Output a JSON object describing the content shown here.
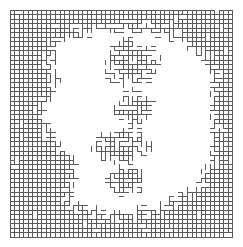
{
  "figure": {
    "kind": "bond-percolation-lattice",
    "title": "",
    "caption": "",
    "background_color": "#ffffff",
    "line_color": "#5a5a5a",
    "line_width": 1
  },
  "chart_data": {
    "type": "heatmap",
    "title": "",
    "subtitle": "",
    "xlabel": "",
    "ylabel": "",
    "grid": true,
    "legend": null,
    "lattice": {
      "columns": 49,
      "rows": 50,
      "cell_size": 4.55,
      "origin_x": 10,
      "origin_y": 10,
      "description": "Square lattice of sites; occupied bonds drawn as short segments between neighbouring sites. Dense occupation forms a connected perimeter ring; interior is mostly empty with one isolated interior cluster.",
      "occupancy_model": "region",
      "regions": [
        {
          "name": "outer-perimeter-band",
          "role": "dense",
          "probability": 0.97,
          "note": "Near-fully occupied band hugging all four edges of the lattice."
        },
        {
          "name": "perimeter-fringe",
          "role": "ragged-boundary",
          "probability": 0.55,
          "note": "Irregular, jagged inner boundary of the dense band; thickness varies from 1 to 10 cells."
        },
        {
          "name": "interior-void",
          "role": "empty",
          "probability": 0.0,
          "note": "Large blank elliptical interior where no bonds are present."
        },
        {
          "name": "interior-island-cluster",
          "role": "isolated-cluster",
          "probability": 0.85,
          "note": "Detached mid-size cluster floating in the interior void, roughly centred, shaped like a vertical chain of blobs."
        }
      ],
      "band_thickness_top": [
        10,
        10,
        10,
        10,
        9,
        9,
        8,
        8,
        7,
        6,
        5,
        5,
        4,
        4,
        4,
        4,
        4,
        4,
        3,
        3,
        3,
        3,
        3,
        3,
        3,
        3,
        3,
        3,
        3,
        3,
        3,
        4,
        4,
        4,
        4,
        5,
        5,
        5,
        6,
        7,
        8,
        8,
        9,
        10,
        10,
        10,
        10,
        10,
        10
      ],
      "band_thickness_bottom": [
        12,
        12,
        12,
        11,
        11,
        11,
        10,
        10,
        9,
        9,
        8,
        8,
        7,
        7,
        6,
        6,
        5,
        5,
        5,
        4,
        4,
        4,
        4,
        4,
        4,
        4,
        4,
        4,
        5,
        5,
        5,
        5,
        6,
        6,
        6,
        7,
        7,
        8,
        8,
        9,
        9,
        10,
        10,
        11,
        11,
        12,
        12,
        12,
        12
      ],
      "band_thickness_left": [
        10,
        10,
        10,
        10,
        10,
        9,
        9,
        9,
        8,
        8,
        8,
        8,
        8,
        9,
        9,
        9,
        9,
        8,
        8,
        7,
        7,
        6,
        6,
        6,
        6,
        7,
        7,
        8,
        8,
        9,
        10,
        11,
        12,
        13,
        13,
        13,
        13,
        12,
        12,
        12,
        12,
        12,
        12,
        12,
        12,
        12,
        12,
        12,
        12,
        12
      ],
      "band_thickness_right": [
        8,
        8,
        8,
        8,
        7,
        7,
        6,
        6,
        5,
        5,
        4,
        4,
        4,
        3,
        3,
        3,
        3,
        3,
        3,
        3,
        3,
        3,
        3,
        3,
        3,
        3,
        3,
        3,
        3,
        3,
        3,
        3,
        3,
        4,
        4,
        5,
        5,
        6,
        6,
        7,
        7,
        8,
        8,
        8,
        9,
        9,
        10,
        10,
        10,
        10
      ],
      "interior_clusters": [
        {
          "name": "upper-blob",
          "col_range": [
            20,
            32
          ],
          "row_range": [
            6,
            16
          ],
          "cells": 46
        },
        {
          "name": "mid-blob",
          "col_range": [
            23,
            31
          ],
          "row_range": [
            17,
            25
          ],
          "cells": 34
        },
        {
          "name": "lower-blob",
          "col_range": [
            18,
            30
          ],
          "row_range": [
            26,
            33
          ],
          "cells": 38
        },
        {
          "name": "tail-thread",
          "col_range": [
            21,
            29
          ],
          "row_range": [
            34,
            40
          ],
          "cells": 18
        }
      ]
    }
  },
  "render": {
    "seed": 20240517,
    "note": "Bond occupancy reproduced from region model above."
  }
}
